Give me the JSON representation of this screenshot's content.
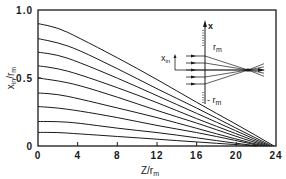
{
  "chart_data": {
    "type": "line",
    "title": "",
    "xlabel": "Z/r_m",
    "ylabel": "x_in/r_m",
    "xlim": [
      0,
      24
    ],
    "ylim": [
      0,
      1.0
    ],
    "xticks": [
      "0",
      "4",
      "8",
      "12",
      "16",
      "20",
      "24"
    ],
    "yticks": [
      "0",
      "0.5",
      "1.0"
    ],
    "grid": false,
    "legend": null,
    "series": [
      {
        "name": "x_in=0.9",
        "x": [
          0,
          2,
          4,
          8,
          12,
          16,
          20,
          23.8
        ],
        "y": [
          0.9,
          0.87,
          0.8,
          0.65,
          0.49,
          0.32,
          0.16,
          0.0
        ]
      },
      {
        "name": "x_in=0.8",
        "x": [
          0,
          2,
          4,
          8,
          12,
          16,
          20,
          23.6
        ],
        "y": [
          0.79,
          0.76,
          0.71,
          0.57,
          0.42,
          0.28,
          0.13,
          0.0
        ]
      },
      {
        "name": "x_in=0.7",
        "x": [
          0,
          2,
          4,
          8,
          12,
          16,
          20,
          23.4
        ],
        "y": [
          0.69,
          0.67,
          0.62,
          0.5,
          0.37,
          0.24,
          0.11,
          0.0
        ]
      },
      {
        "name": "x_in=0.6",
        "x": [
          0,
          2,
          4,
          8,
          12,
          16,
          20,
          23.2
        ],
        "y": [
          0.59,
          0.57,
          0.53,
          0.43,
          0.32,
          0.2,
          0.09,
          0.0
        ]
      },
      {
        "name": "x_in=0.5",
        "x": [
          0,
          2,
          4,
          8,
          12,
          16,
          20,
          23.0
        ],
        "y": [
          0.5,
          0.48,
          0.45,
          0.36,
          0.26,
          0.17,
          0.07,
          0.0
        ]
      },
      {
        "name": "x_in=0.4",
        "x": [
          0,
          2,
          4,
          8,
          12,
          16,
          20,
          22.8
        ],
        "y": [
          0.39,
          0.38,
          0.35,
          0.28,
          0.21,
          0.13,
          0.05,
          0.0
        ]
      },
      {
        "name": "x_in=0.3",
        "x": [
          0,
          2,
          4,
          8,
          12,
          16,
          20,
          22.5
        ],
        "y": [
          0.29,
          0.28,
          0.26,
          0.21,
          0.15,
          0.1,
          0.04,
          0.0
        ]
      },
      {
        "name": "x_in=0.2",
        "x": [
          0,
          2,
          4,
          8,
          12,
          16,
          20,
          22.2
        ],
        "y": [
          0.18,
          0.18,
          0.17,
          0.13,
          0.1,
          0.06,
          0.02,
          0.0
        ]
      },
      {
        "name": "x_in=0.1",
        "x": [
          0,
          2,
          4,
          8,
          12,
          16,
          20,
          22.0
        ],
        "y": [
          0.1,
          0.1,
          0.09,
          0.07,
          0.05,
          0.03,
          0.01,
          0.0
        ]
      }
    ],
    "annotations": {
      "inset": {
        "labels": [
          "x",
          "r_m",
          "x_in",
          "-r_m"
        ],
        "description": "Schematic of parallel rays entering a lens aperture between -r_m and r_m, converging to a focus on the axis"
      }
    }
  },
  "labels": {
    "y_axis_main": "x",
    "y_axis_sub": "in",
    "y_axis_rest": "/r",
    "y_axis_sub2": "m",
    "x_axis_main": "Z/r",
    "x_axis_sub": "m",
    "inset_x": "x",
    "inset_rm": "r",
    "inset_rm_sub": "m",
    "inset_xin": "x",
    "inset_xin_sub": "in",
    "inset_neg_rm": "- r",
    "inset_neg_rm_sub": "m"
  }
}
